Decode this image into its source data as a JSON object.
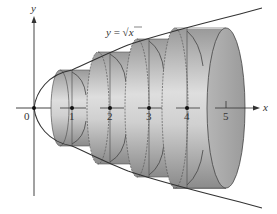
{
  "figure": {
    "curve_label": "y = √x",
    "curve_label_parts": {
      "lhs": "y",
      "eq": " = ",
      "radical": "√",
      "arg": "x"
    },
    "axes": {
      "x_label": "x",
      "y_label": "y",
      "origin_label": "0",
      "x_ticks": [
        "1",
        "2",
        "3",
        "4",
        "5"
      ]
    },
    "disks": [
      {
        "index": 1,
        "center_x": 1
      },
      {
        "index": 2,
        "center_x": 2
      },
      {
        "index": 3,
        "center_x": 3
      },
      {
        "index": 4,
        "center_x": 4
      }
    ],
    "colors": {
      "curve": "#333333",
      "disk_light": "#d9d9d9",
      "disk_dark": "#8f8f8f",
      "end_face": "#a6a6a6",
      "axis": "#444444"
    }
  }
}
